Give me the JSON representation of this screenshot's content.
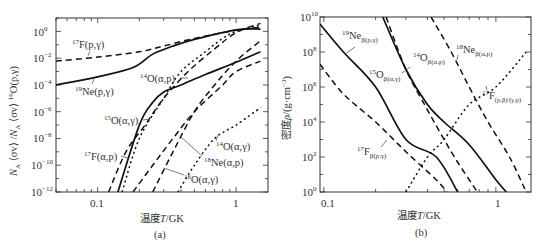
{
  "chart_data": [
    {
      "type": "line",
      "panel": "(a)",
      "title": "",
      "xlabel": "温度T/GK",
      "ylabel": "N_A⟨σv⟩/N_A⟨σv⟩ 16O(p,γ)",
      "xscale": "log",
      "yscale": "log",
      "xlim": [
        0.05,
        1.7
      ],
      "ylim": [
        1e-12,
        10
      ],
      "x_ticks": [
        "0.1",
        "1"
      ],
      "y_ticks": [
        "10^0",
        "10^-2",
        "10^-4",
        "10^-6",
        "10^-8",
        "10^-10",
        "10^-12"
      ],
      "series": [
        {
          "name": "17F(p,γ)",
          "style": "dashed",
          "x": [
            0.05,
            0.1,
            0.2,
            0.3,
            0.5,
            1.0,
            1.5
          ],
          "y": [
            0.006,
            0.012,
            0.03,
            0.08,
            0.3,
            1.2,
            2.0
          ]
        },
        {
          "name": "19Ne(p,γ)",
          "style": "solid",
          "x": [
            0.05,
            0.1,
            0.18,
            0.25,
            0.35,
            0.5,
            1.0,
            1.5
          ],
          "y": [
            0.0001,
            0.0004,
            0.002,
            0.02,
            0.08,
            0.25,
            1.3,
            1.5
          ]
        },
        {
          "name": "14O(α,p)",
          "style": "solid",
          "x": [
            0.14,
            0.2,
            0.25,
            0.3,
            0.4,
            0.6,
            1.0,
            1.5
          ],
          "y": [
            1e-12,
            1e-07,
            5e-06,
            3e-05,
            0.0001,
            0.0006,
            0.005,
            0.03
          ]
        },
        {
          "name": "15O(α,γ)",
          "style": "dotted",
          "x": [
            0.15,
            0.2,
            0.3,
            0.4,
            0.6,
            0.8,
            1.0,
            1.5
          ],
          "y": [
            1e-12,
            1e-08,
            1e-05,
            0.001,
            0.03,
            0.3,
            1.0,
            3.0
          ]
        },
        {
          "name": "17F(α,p)",
          "style": "dashed",
          "x": [
            0.12,
            0.16,
            0.22,
            0.3,
            0.45,
            0.7,
            1.0,
            1.5
          ],
          "y": [
            1e-12,
            1e-09,
            1e-07,
            1e-05,
            0.001,
            0.05,
            0.8,
            4.0
          ]
        },
        {
          "name": "18Ne(α,p)",
          "style": "dashed",
          "x": [
            0.25,
            0.35,
            0.5,
            0.7,
            1.0,
            1.5
          ],
          "y": [
            1e-12,
            1e-09,
            1e-06,
            0.0001,
            0.006,
            0.2
          ]
        },
        {
          "name": "16O(α,γ)",
          "style": "dashed",
          "x": [
            0.18,
            0.25,
            0.35,
            0.5,
            0.8,
            1.0,
            1.5
          ],
          "y": [
            1e-12,
            1e-10,
            1e-08,
            1e-06,
            0.0001,
            0.001,
            0.006
          ]
        },
        {
          "name": "14O(α,γ)",
          "style": "dotted",
          "x": [
            0.38,
            0.5,
            0.7,
            1.0,
            1.5
          ],
          "y": [
            1e-12,
            1e-10,
            1e-08,
            1e-07,
            2e-06
          ]
        }
      ],
      "annotations": [
        "17F(p,γ)",
        "19Ne(p,γ)",
        "14O(α,p)",
        "15O(α,γ)",
        "17F(α,p)",
        "14O(α,γ)",
        "18Ne(α,p)",
        "16O(α,γ)"
      ]
    },
    {
      "type": "line",
      "panel": "(b)",
      "title": "",
      "xlabel": "温度T/GK",
      "ylabel": "密度ρ/(g·cm⁻³)",
      "xscale": "log",
      "yscale": "log",
      "xlim": [
        0.095,
        1.6
      ],
      "ylim": [
        1,
        10000000000.0
      ],
      "x_ticks": [
        "0.1",
        "1"
      ],
      "y_ticks": [
        "10^10",
        "10^8",
        "10^6",
        "10^4",
        "10^2",
        "10^0"
      ],
      "series": [
        {
          "name": "19Neβ(p,γ)",
          "style": "solid",
          "x": [
            0.095,
            0.13,
            0.2,
            0.3,
            0.45,
            0.6
          ],
          "y": [
            4000000000.0,
            100000000.0,
            1000000.0,
            1000.0,
            100.0,
            1
          ]
        },
        {
          "name": "17Fβ(p,γ)",
          "style": "dashed",
          "x": [
            0.095,
            0.13,
            0.2,
            0.3,
            0.45,
            0.52
          ],
          "y": [
            20000000.0,
            400000.0,
            10000.0,
            200.0,
            5,
            1
          ]
        },
        {
          "name": "15Oβ(α,γ)",
          "style": "solid",
          "x": [
            0.22,
            0.3,
            0.4,
            0.5,
            0.7,
            1.0,
            1.15
          ],
          "y": [
            10000000000.0,
            10000000.0,
            100000.0,
            10000.0,
            500.0,
            5,
            1
          ]
        },
        {
          "name": "14Oβ(α,p)",
          "style": "dashed",
          "x": [
            0.23,
            0.3,
            0.4,
            0.5,
            0.6,
            0.78
          ],
          "y": [
            10000000000.0,
            10000000.0,
            50000.0,
            1000.0,
            50,
            1
          ]
        },
        {
          "name": "18Neβ(α,p)",
          "style": "dashed",
          "x": [
            0.42,
            0.55,
            0.7,
            0.9,
            1.2,
            1.5
          ],
          "y": [
            10000000000.0,
            100000000.0,
            1000000.0,
            10000.0,
            100.0,
            1
          ]
        },
        {
          "name": "17F(p,β)/(γ,p)",
          "style": "dotted",
          "x": [
            0.3,
            0.4,
            0.5,
            0.7,
            1.0,
            1.5
          ],
          "y": [
            1,
            100.0,
            1000.0,
            100000.0,
            1000000.0,
            100000000.0
          ]
        }
      ],
      "annotations": [
        "19Neβ(p,γ)",
        "15Oβ(α,γ)",
        "14Oβ(α,p)",
        "18Neβ(α,p)",
        "17F(p,β)/(γ,p)",
        "17Fβ(p,γ)"
      ]
    }
  ],
  "panel_a": {
    "caption": "(a)",
    "xlabel_cn": "温度",
    "xlabel_var": "T",
    "xlabel_unit": "/GK",
    "ytick_labels": [
      "10",
      "10",
      "10",
      "10",
      "10",
      "10",
      "10"
    ],
    "ytick_exps": [
      "0",
      "−2",
      "−4",
      "−6",
      "−8",
      "−10",
      "−12"
    ],
    "xtick_labels": [
      "0.1",
      "1"
    ],
    "labels": {
      "f17pg": {
        "pre": "17",
        "main": "F(p,γ)"
      },
      "ne19pg": {
        "pre": "19",
        "main": "Ne(p,γ)"
      },
      "o14ap": {
        "pre": "14",
        "main": "O(α,p)"
      },
      "o15ag": {
        "pre": "15",
        "main": "O(α,γ)"
      },
      "f17ap": {
        "pre": "17",
        "main": "F(α,p)"
      },
      "o14ag": {
        "pre": "14",
        "main": "O(α,γ)"
      },
      "ne18ap": {
        "pre": "18",
        "main": "Ne(α,p)"
      },
      "o16ag": {
        "pre": "16",
        "main": "O(α,γ)"
      }
    },
    "ylabel": {
      "na1": "N",
      "sub1": "A",
      "mid1": " ⟨σv⟩ /",
      "na2": "N",
      "sub2": "A",
      "mid2": " ⟨σv⟩ ",
      "pre": "16",
      "tail": "O(p,γ)"
    }
  },
  "panel_b": {
    "caption": "(b)",
    "xlabel_cn": "温度",
    "xlabel_var": "T",
    "xlabel_unit": "/GK",
    "ytick_labels": [
      "10",
      "10",
      "10",
      "10",
      "10",
      "10"
    ],
    "ytick_exps": [
      "10",
      "8",
      "6",
      "4",
      "2",
      "0"
    ],
    "xtick_labels": [
      "0.1",
      "1"
    ],
    "ylabel": {
      "cn": "密度",
      "var": "ρ",
      "unit": "/(g·cm",
      "exp": "−3",
      "close": ")"
    },
    "labels": {
      "ne19": {
        "pre": "19",
        "main": "Ne",
        "sub": "β(p,γ)"
      },
      "o15": {
        "pre": "15",
        "main": "O",
        "sub": "β(α,γ)"
      },
      "o14": {
        "pre": "14",
        "main": "O",
        "sub": "β(α,p)"
      },
      "ne18": {
        "pre": "18",
        "main": "Ne",
        "sub": "β(α,p)"
      },
      "f17pb": {
        "pre": "17",
        "main": "F",
        "sub": "(p,β)/(γ,p)"
      },
      "f17b": {
        "pre": "17",
        "main": "F",
        "sub": "β(p,γ)"
      }
    }
  }
}
